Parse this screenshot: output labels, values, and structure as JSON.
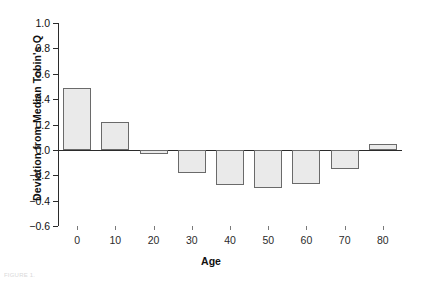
{
  "chart_data": {
    "type": "bar",
    "title": "",
    "xlabel": "Age",
    "ylabel": "Deviation from Median Tobin's Q",
    "categories": [
      "0",
      "10",
      "20",
      "30",
      "40",
      "50",
      "60",
      "70",
      "80"
    ],
    "values": [
      0.49,
      0.22,
      -0.03,
      -0.18,
      -0.28,
      -0.3,
      -0.27,
      -0.15,
      0.05
    ],
    "ylim": [
      -0.6,
      1.0
    ],
    "yticks": [
      "1.0",
      "0.8",
      "0.6",
      "0.4",
      "0.2",
      "0.0",
      "-0.2",
      "-0.4",
      "-0.6"
    ],
    "ytick_values": [
      1.0,
      0.8,
      0.6,
      0.4,
      0.2,
      0.0,
      -0.2,
      -0.4,
      -0.6
    ],
    "xticks": [
      "0",
      "10",
      "20",
      "30",
      "40",
      "50",
      "60",
      "70",
      "80"
    ],
    "grid": false,
    "legend": false,
    "legend_position": "none",
    "bar_fill_color": "#eaeaea",
    "bar_edge_color": "#6a6a6a",
    "axis_color": "#2b2b2b",
    "background_color": "#ffffff"
  },
  "caption": {
    "cutoff_text": "FIGURE 1."
  }
}
